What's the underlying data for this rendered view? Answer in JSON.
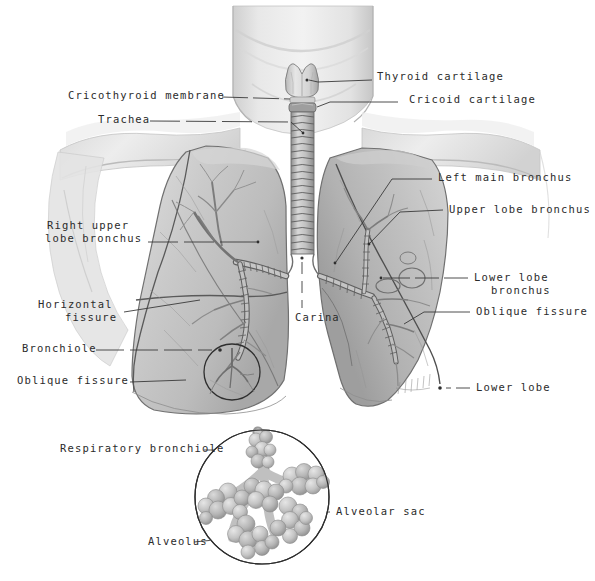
{
  "figure": {
    "style": "grayscale anatomical illustration with leader-line labels",
    "background_color": "#ffffff",
    "text_color": "#2b2b2b",
    "leader_line_color": "#3a3a3a"
  },
  "labels": {
    "thyroid_cartilage": "Thyroid cartilage",
    "cricoid_cartilage": "Cricoid cartilage",
    "cricothyroid_membrane": "Cricothyroid membrane",
    "trachea": "Trachea",
    "left_main_bronchus": "Left main bronchus",
    "upper_lobe_bronchus": "Upper lobe bronchus",
    "lower_lobe_bronchus_line1": "Lower lobe",
    "lower_lobe_bronchus_line2": "bronchus",
    "right_upper_lobe_bronchus_line1": "Right upper",
    "right_upper_lobe_bronchus_line2": "lobe bronchus",
    "horizontal_fissure_line1": "Horizontal",
    "horizontal_fissure_line2": "fissure",
    "bronchiole": "Bronchiole",
    "oblique_fissure_left": "Oblique fissure",
    "oblique_fissure_right": "Oblique fissure",
    "lower_lobe": "Lower lobe",
    "carina": "Carina",
    "respiratory_bronchiole": "Respiratory bronchiole",
    "alveolar_sac": "Alveolar sac",
    "alveolus": "Alveolus"
  },
  "structures": {
    "larynx": [
      "thyroid cartilage",
      "cricoid cartilage",
      "cricothyroid membrane"
    ],
    "airways": [
      "trachea",
      "carina",
      "left main bronchus",
      "upper lobe bronchus",
      "lower lobe bronchus",
      "right upper lobe bronchus",
      "bronchiole",
      "respiratory bronchiole"
    ],
    "lung_right_lobes": [
      "upper lobe",
      "middle lobe",
      "lower lobe"
    ],
    "lung_left_lobes": [
      "upper lobe",
      "lower lobe"
    ],
    "fissures": [
      "horizontal fissure",
      "oblique fissure"
    ],
    "gas_exchange": [
      "alveolar sac",
      "alveolus"
    ]
  },
  "insets": {
    "small_circle_caption": "bronchiole detail on right lower lobe",
    "large_circle_caption": "magnified alveolar cluster"
  }
}
